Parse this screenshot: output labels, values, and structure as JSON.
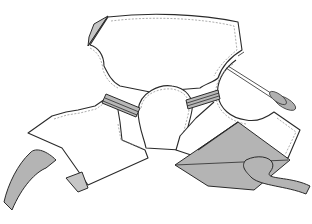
{
  "diagram": {
    "elements": [
      {
        "name": "back-bodice-piece",
        "fill": "#ffffff"
      },
      {
        "name": "left-sleeve-piece",
        "fill": "#ffffff"
      },
      {
        "name": "right-sleeve-piece",
        "fill": "#ffffff"
      },
      {
        "name": "neck-curve-piece",
        "fill": "#ffffff"
      },
      {
        "name": "left-binding-strip",
        "fill": "#b8b8b8"
      },
      {
        "name": "right-binding-strip",
        "fill": "#b8b8b8"
      },
      {
        "name": "folded-corner-top-left",
        "fill": "#c6c6c6"
      },
      {
        "name": "ribbon-tie-left",
        "fill": "#b4b4b4"
      },
      {
        "name": "ribbon-tie-right",
        "fill": "#b4b4b4"
      },
      {
        "name": "folded-flap-bottom-right",
        "fill": "#b4b4b4"
      },
      {
        "name": "scissors",
        "fill": "#b0b0b0"
      }
    ],
    "colors": {
      "outline": "#2a2a2a",
      "seam_line": "#8a8a8a",
      "shade": "#b4b4b4",
      "background": "#ffffff"
    }
  }
}
